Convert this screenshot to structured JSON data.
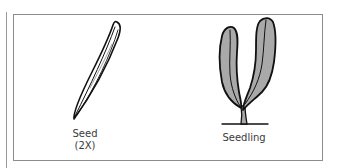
{
  "figure": {
    "panels": [
      {
        "id": "seed",
        "label_line1": "Seed",
        "label_line2": "(2X)"
      },
      {
        "id": "seedling",
        "label_line1": "Seedling"
      }
    ]
  },
  "colors": {
    "frame": "#8c8c8c",
    "ink": "#111111",
    "leaf_fill": "#a9a9a9",
    "text": "#3a3a3a"
  }
}
